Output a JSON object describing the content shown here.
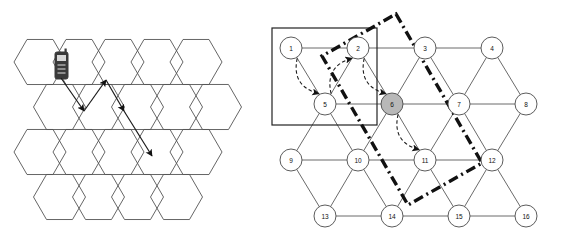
{
  "figure": {
    "title": "",
    "background_color": "#ffffff",
    "width": 573,
    "height": 246,
    "panels": [
      "cellular-honeycomb-panel",
      "lattice-graph-panel"
    ]
  },
  "colors": {
    "stroke": "#444444",
    "hex_stroke": "#555555",
    "node_stroke": "#4a4a4a",
    "node_fill": "#ffffff",
    "highlight_node_fill": "#b8b8b8",
    "arrow": "#1a1a1a",
    "dashdot": "#111111",
    "rect": "#222222",
    "phone_body": "#3a3a3a",
    "phone_screen": "#d8d8d8"
  },
  "left_panel": {
    "name": "cellular-honeycomb",
    "description": "Honeycomb of flat-top hexagonal cells with a mobile handset icon and a zig-zag handover arrow path",
    "hex": {
      "radius": 26,
      "rows": 4,
      "columns_per_row": [
        5,
        5,
        5,
        4
      ],
      "origin_x": 40,
      "origin_y": 62,
      "x_step": 39,
      "y_step": 45,
      "row_offsets": [
        0,
        19.5,
        0,
        19.5
      ]
    },
    "mobile_icon": {
      "label": "mobile-phone",
      "x": 55,
      "y": 52,
      "width": 13,
      "height": 27
    },
    "arrow_path": {
      "label": "handover-zigzag-path",
      "points": [
        {
          "x": 61,
          "y": 78
        },
        {
          "x": 84,
          "y": 111
        },
        {
          "x": 106,
          "y": 80
        },
        {
          "x": 124,
          "y": 111
        },
        {
          "x": 152,
          "y": 156
        }
      ],
      "segments": [
        {
          "from": 0,
          "to": 1,
          "arrowhead": true
        },
        {
          "from": 1,
          "to": 2,
          "arrowhead": true
        },
        {
          "from": 2,
          "to": 3,
          "arrowhead": true
        },
        {
          "from": 3,
          "to": 4,
          "arrowhead": true
        }
      ]
    }
  },
  "right_panel": {
    "name": "lattice-graph",
    "description": "4 by 4 staggered lattice of numbered circular nodes with solid rectangle region, dash-dot rhombus boundary and curved dashed traversal arrows",
    "node_radius": 11,
    "nodes": [
      {
        "id": 1,
        "label": "1",
        "x": 291,
        "y": 48,
        "highlighted": false
      },
      {
        "id": 2,
        "label": "2",
        "x": 358,
        "y": 48,
        "highlighted": false
      },
      {
        "id": 3,
        "label": "3",
        "x": 425,
        "y": 48,
        "highlighted": false
      },
      {
        "id": 4,
        "label": "4",
        "x": 492,
        "y": 48,
        "highlighted": false
      },
      {
        "id": 5,
        "label": "5",
        "x": 325,
        "y": 104,
        "highlighted": false
      },
      {
        "id": 6,
        "label": "6",
        "x": 392,
        "y": 104,
        "highlighted": true
      },
      {
        "id": 7,
        "label": "7",
        "x": 459,
        "y": 104,
        "highlighted": false
      },
      {
        "id": 8,
        "label": "8",
        "x": 526,
        "y": 104,
        "highlighted": false
      },
      {
        "id": 9,
        "label": "9",
        "x": 291,
        "y": 160,
        "highlighted": false
      },
      {
        "id": 10,
        "label": "10",
        "x": 358,
        "y": 160,
        "highlighted": false
      },
      {
        "id": 11,
        "label": "11",
        "x": 425,
        "y": 160,
        "highlighted": false
      },
      {
        "id": 12,
        "label": "12",
        "x": 492,
        "y": 160,
        "highlighted": false
      },
      {
        "id": 13,
        "label": "13",
        "x": 325,
        "y": 216,
        "highlighted": false
      },
      {
        "id": 14,
        "label": "14",
        "x": 392,
        "y": 216,
        "highlighted": false
      },
      {
        "id": 15,
        "label": "15",
        "x": 459,
        "y": 216,
        "highlighted": false
      },
      {
        "id": 16,
        "label": "16",
        "x": 526,
        "y": 216,
        "highlighted": false
      }
    ],
    "edges": [
      [
        1,
        2
      ],
      [
        2,
        3
      ],
      [
        3,
        4
      ],
      [
        5,
        6
      ],
      [
        6,
        7
      ],
      [
        7,
        8
      ],
      [
        9,
        10
      ],
      [
        10,
        11
      ],
      [
        11,
        12
      ],
      [
        13,
        14
      ],
      [
        14,
        15
      ],
      [
        15,
        16
      ],
      [
        1,
        5
      ],
      [
        2,
        5
      ],
      [
        2,
        6
      ],
      [
        3,
        6
      ],
      [
        3,
        7
      ],
      [
        4,
        7
      ],
      [
        4,
        8
      ],
      [
        5,
        9
      ],
      [
        5,
        10
      ],
      [
        6,
        10
      ],
      [
        6,
        11
      ],
      [
        7,
        11
      ],
      [
        7,
        12
      ],
      [
        8,
        12
      ],
      [
        9,
        13
      ],
      [
        10,
        13
      ],
      [
        10,
        14
      ],
      [
        11,
        14
      ],
      [
        11,
        15
      ],
      [
        12,
        15
      ],
      [
        12,
        16
      ]
    ],
    "highlight_rectangle": {
      "label": "selected-region-rectangle",
      "x": 272,
      "y": 28,
      "width": 105,
      "height": 97
    },
    "rhombus_boundary": {
      "label": "dash-dot-rhombus-boundary",
      "style": "dash-dot",
      "points": [
        {
          "x": 396,
          "y": 14
        },
        {
          "x": 482,
          "y": 163
        },
        {
          "x": 408,
          "y": 205
        },
        {
          "x": 322,
          "y": 56
        }
      ]
    },
    "traversal_arrows": [
      {
        "label": "arrow-1-to-5",
        "from": 1,
        "to": 5,
        "curve": 0.3
      },
      {
        "label": "arrow-5-to-2",
        "from": 5,
        "to": 2,
        "curve": -0.3
      },
      {
        "label": "arrow-2-to-6",
        "from": 2,
        "to": 6,
        "curve": 0.3
      },
      {
        "label": "arrow-6-to-11",
        "from": 6,
        "to": 11,
        "curve": 0.3
      }
    ]
  }
}
